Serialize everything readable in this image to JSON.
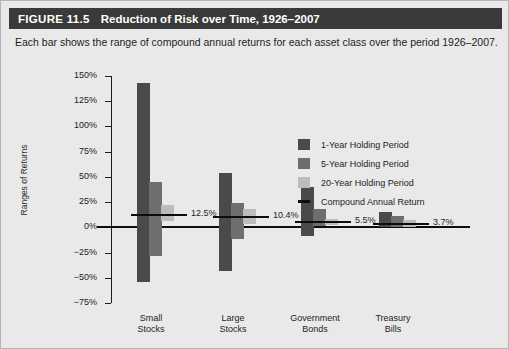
{
  "figure": {
    "label": "FIGURE 11.5",
    "title": "Reduction of Risk over Time, 1926–2007",
    "subtitle": "Each bar shows the range of compound annual returns for each asset class over the period 1926–2007."
  },
  "colors": {
    "header_bg": "#3a3a3a",
    "panel_bg": "#e9e9e9",
    "series_1_year": "#4a4a4a",
    "series_5_year": "#6e6e6e",
    "series_20_year": "#bcbcbc",
    "compound_line": "#0d0d0d"
  },
  "legend": {
    "items": [
      {
        "label": "1-Year Holding Period",
        "marker": "swatch",
        "color": "#4a4a4a"
      },
      {
        "label": "5-Year Holding Period",
        "marker": "swatch",
        "color": "#6e6e6e"
      },
      {
        "label": "20-Year Holding Period",
        "marker": "swatch",
        "color": "#bcbcbc"
      },
      {
        "label": "Compound Annual Return",
        "marker": "line",
        "color": "#0d0d0d"
      }
    ]
  },
  "chart_data": {
    "type": "bar",
    "title": "Reduction of Risk over Time, 1926–2007",
    "subtitle": "Each bar shows the range of compound annual returns for each asset class over the period 1926–2007.",
    "xlabel": "",
    "ylabel": "Ranges of Returns",
    "ylim": [
      -75,
      150
    ],
    "ytick_labels": [
      "150%",
      "125%",
      "100%",
      "75%",
      "50%",
      "25%",
      "0%",
      "−25%",
      "−50%",
      "−75%"
    ],
    "ytick_values": [
      150,
      125,
      100,
      75,
      50,
      25,
      0,
      -25,
      -50,
      -75
    ],
    "grid": false,
    "legend_position": "upper right",
    "categories": [
      "Small Stocks",
      "Large Stocks",
      "Government Bonds",
      "Treasury Bills"
    ],
    "category_lines": [
      [
        "Small",
        "Stocks"
      ],
      [
        "Large",
        "Stocks"
      ],
      [
        "Government",
        "Bonds"
      ],
      [
        "Treasury",
        "Bills"
      ]
    ],
    "series": [
      {
        "name": "1-Year Holding Period",
        "color": "#4a4a4a",
        "ranges": [
          {
            "category": "Small Stocks",
            "low": -54,
            "high": 143
          },
          {
            "category": "Large Stocks",
            "low": -43,
            "high": 54
          },
          {
            "category": "Government Bonds",
            "low": -9,
            "high": 40
          },
          {
            "category": "Treasury Bills",
            "low": 0,
            "high": 15
          }
        ]
      },
      {
        "name": "5-Year Holding Period",
        "color": "#6e6e6e",
        "ranges": [
          {
            "category": "Small Stocks",
            "low": -28,
            "high": 45
          },
          {
            "category": "Large Stocks",
            "low": -12,
            "high": 24
          },
          {
            "category": "Government Bonds",
            "low": 1,
            "high": 18
          },
          {
            "category": "Treasury Bills",
            "low": 0,
            "high": 11
          }
        ]
      },
      {
        "name": "20-Year Holding Period",
        "color": "#bcbcbc",
        "ranges": [
          {
            "category": "Small Stocks",
            "low": 6,
            "high": 22
          },
          {
            "category": "Large Stocks",
            "low": 3,
            "high": 18
          },
          {
            "category": "Government Bonds",
            "low": 2,
            "high": 8
          },
          {
            "category": "Treasury Bills",
            "low": 0,
            "high": 7
          }
        ]
      }
    ],
    "compound_annual_returns": [
      {
        "category": "Small Stocks",
        "value": 12.5,
        "label": "12.5%"
      },
      {
        "category": "Large Stocks",
        "value": 10.4,
        "label": "10.4%"
      },
      {
        "category": "Government Bonds",
        "value": 5.5,
        "label": "5.5%"
      },
      {
        "category": "Treasury Bills",
        "value": 3.7,
        "label": "3.7%"
      }
    ]
  }
}
